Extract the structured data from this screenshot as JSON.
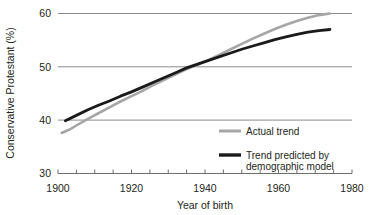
{
  "chart_data": {
    "type": "line",
    "title": "",
    "xlabel": "Year of birth",
    "ylabel": "Conservative Protestant (%)",
    "xlim": [
      1900,
      1980
    ],
    "ylim": [
      30,
      60
    ],
    "xticks": [
      1900,
      1905,
      1910,
      1915,
      1920,
      1925,
      1930,
      1935,
      1940,
      1945,
      1950,
      1955,
      1960,
      1965,
      1970,
      1975,
      1980
    ],
    "xtick_labels": [
      "1900",
      "",
      "",
      "",
      "1920",
      "",
      "",
      "",
      "1940",
      "",
      "",
      "",
      "1960",
      "",
      "",
      "",
      "1980"
    ],
    "yticks": [
      30,
      40,
      50,
      60
    ],
    "ytick_labels": [
      "30",
      "40",
      "50",
      "60"
    ],
    "grid": true,
    "grid_color": "#808080",
    "legend_position": "bottom-right",
    "series": [
      {
        "name": "Actual trend",
        "color": "#a6a6a6",
        "width": 2.6,
        "x": [
          1901,
          1903,
          1905,
          1908,
          1911,
          1914,
          1917,
          1920,
          1923,
          1926,
          1929,
          1932,
          1935,
          1938,
          1941,
          1944,
          1947,
          1950,
          1953,
          1956,
          1959,
          1962,
          1965,
          1968,
          1971,
          1974
        ],
        "y": [
          37.6,
          38.2,
          39.0,
          40.2,
          41.3,
          42.4,
          43.5,
          44.5,
          45.5,
          46.6,
          47.6,
          48.6,
          49.6,
          50.4,
          51.3,
          52.3,
          53.3,
          54.3,
          55.3,
          56.2,
          57.1,
          57.9,
          58.6,
          59.2,
          59.7,
          60.0
        ]
      },
      {
        "name": "Trend predicted by demographic model",
        "color": "#1a1a1a",
        "width": 2.8,
        "x": [
          1902,
          1905,
          1908,
          1911,
          1914,
          1917,
          1920,
          1923,
          1926,
          1929,
          1932,
          1935,
          1938,
          1941,
          1944,
          1947,
          1950,
          1953,
          1956,
          1959,
          1962,
          1965,
          1968,
          1971,
          1974
        ],
        "y": [
          39.9,
          40.9,
          41.9,
          42.8,
          43.6,
          44.5,
          45.3,
          46.2,
          47.1,
          48.0,
          48.9,
          49.8,
          50.5,
          51.2,
          51.9,
          52.6,
          53.3,
          53.9,
          54.5,
          55.1,
          55.6,
          56.1,
          56.5,
          56.8,
          57.0
        ]
      }
    ],
    "legend_entries": [
      {
        "label": "Actual trend",
        "color": "#a6a6a6"
      },
      {
        "label_line1": "Trend predicted by",
        "label_line2": "demographic model",
        "color": "#1a1a1a"
      }
    ]
  },
  "axis": {
    "y_title": "Conservative Protestant (%)",
    "x_title": "Year of birth",
    "y_labels": [
      "60",
      "50",
      "40",
      "30"
    ],
    "x_labels": [
      "1900",
      "1920",
      "1940",
      "1960",
      "1980"
    ]
  },
  "legend": {
    "actual_label": "Actual trend",
    "predicted_line1": "Trend predicted by",
    "predicted_line2": "demographic model"
  },
  "colors": {
    "actual": "#a6a6a6",
    "predicted": "#1a1a1a",
    "grid": "#808080",
    "text": "#231f20",
    "background": "#ffffff"
  }
}
